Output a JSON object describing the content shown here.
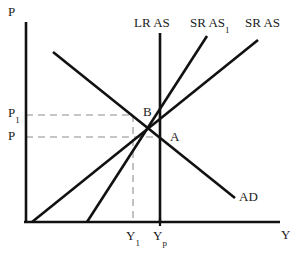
{
  "chart_data": {
    "type": "line",
    "title": "",
    "xlabel": "Y",
    "ylabel": "P",
    "grid": false,
    "legend_position": "inline-curve-labels",
    "axis_origin": [
      26,
      222
    ],
    "axis_x_end": [
      280,
      222
    ],
    "axis_y_end": [
      26,
      22
    ],
    "series": [
      {
        "name": "AD",
        "label": "AD",
        "kind": "aggregate-demand",
        "points": [
          [
            53,
            52
          ],
          [
            235,
            198
          ]
        ],
        "color": "#111111"
      },
      {
        "name": "LR AS",
        "label": "LR AS",
        "kind": "long-run-aggregate-supply",
        "points": [
          [
            160,
            33
          ],
          [
            160,
            222
          ]
        ],
        "color": "#111111"
      },
      {
        "name": "SR AS1",
        "label": "SR AS",
        "label_sub": "1",
        "kind": "short-run-aggregate-supply-shifted",
        "points": [
          [
            87,
            222
          ],
          [
            207,
            36
          ]
        ],
        "color": "#111111"
      },
      {
        "name": "SR AS",
        "label": "SR AS",
        "kind": "short-run-aggregate-supply",
        "points": [
          [
            32,
            222
          ],
          [
            258,
            40
          ]
        ],
        "color": "#111111"
      }
    ],
    "equilibrium_points": [
      {
        "name": "A",
        "label": "A",
        "at": [
          160,
          137
        ],
        "price_label": "P",
        "output_label": "Yp"
      },
      {
        "name": "B",
        "label": "B",
        "at": [
          133,
          115
        ],
        "price_label": "P1",
        "output_label": "Y1"
      }
    ],
    "guides": [
      {
        "name": "price-guide-P1",
        "from": [
          26,
          115
        ],
        "to": [
          133,
          115
        ],
        "style": "dashed",
        "color": "#b3b3b3"
      },
      {
        "name": "price-guide-P",
        "from": [
          26,
          137
        ],
        "to": [
          160,
          137
        ],
        "style": "dashed",
        "color": "#b3b3b3"
      },
      {
        "name": "output-guide-Y1",
        "from": [
          133,
          115
        ],
        "to": [
          133,
          222
        ],
        "style": "dashed",
        "color": "#b3b3b3"
      }
    ],
    "y_ticks": [
      {
        "label": "P1",
        "base": "P",
        "sub": "1",
        "y": 113
      },
      {
        "label": "P",
        "base": "P",
        "sub": "",
        "y": 136
      }
    ],
    "x_ticks": [
      {
        "label": "Y1",
        "base": "Y",
        "sub": "1",
        "x": 133
      },
      {
        "label": "Yp",
        "base": "Y",
        "sub": "p",
        "x": 160
      }
    ],
    "colors": {
      "curve": "#111111",
      "axis": "#111111",
      "guide": "#b3b3b3",
      "text": "#1a1a1a",
      "background": "#ffffff"
    }
  },
  "labels": {
    "axis_y": "P",
    "axis_x": "Y",
    "lras": "LR AS",
    "sras1_base": "SR AS",
    "sras1_sub": "1",
    "sras_base": "SR AS",
    "ad": "AD",
    "point_a": "A",
    "point_b": "B",
    "tick_p1_base": "P",
    "tick_p1_sub": "1",
    "tick_p": "P",
    "tick_y1_base": "Y",
    "tick_y1_sub": "1",
    "tick_yp_base": "Y",
    "tick_yp_sub": "p"
  }
}
